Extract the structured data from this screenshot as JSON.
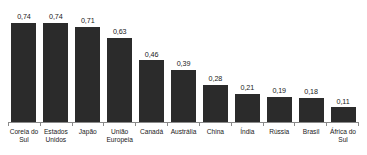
{
  "chart_data": {
    "type": "bar",
    "title": "",
    "subtitle": "",
    "xlabel": "",
    "ylabel": "",
    "ylim": [
      0,
      0.8
    ],
    "grid": false,
    "legend": null,
    "decimal_separator": ",",
    "bar_color": "#2b2b2b",
    "axis_color": "#8a8a8a",
    "categories": [
      "Coreia do Sul",
      "Estados Unidos",
      "Japão",
      "União Europeia",
      "Canadá",
      "Austrália",
      "China",
      "Índia",
      "Rússia",
      "Brasil",
      "África do Sul"
    ],
    "values": [
      0.74,
      0.74,
      0.71,
      0.63,
      0.46,
      0.39,
      0.28,
      0.21,
      0.19,
      0.18,
      0.11
    ],
    "value_labels": [
      "0,74",
      "0,74",
      "0,71",
      "0,63",
      "0,46",
      "0,39",
      "0,28",
      "0,21",
      "0,19",
      "0,18",
      "0,11"
    ]
  }
}
